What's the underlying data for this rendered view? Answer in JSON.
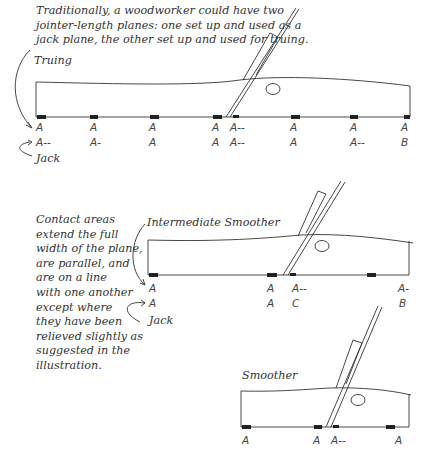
{
  "intro": {
    "lines": [
      "Traditionally, a woodworker could have two",
      "jointer-length planes: one set up and used as a",
      "jack plane, the other set up and used for truing."
    ]
  },
  "side_note": {
    "lines": [
      "Contact areas",
      "extend the full",
      "width of the plane,",
      "are parallel, and",
      "are on a line",
      "with one another",
      "except where",
      "they have been",
      "relieved slightly as",
      "suggested in the",
      "illustration."
    ]
  },
  "planes": [
    {
      "name": "jointer",
      "labels": {
        "top": "Truing",
        "bottom": "Jack"
      },
      "row1": [
        "A",
        "A",
        "A",
        "A",
        "A--",
        "A",
        "A",
        "A"
      ],
      "row2": [
        "A--",
        "A-",
        "A",
        "A",
        "A--",
        "A",
        "A--",
        "B"
      ]
    },
    {
      "name": "Intermediate Smoother",
      "labels": {
        "top": "Intermediate Smoother",
        "bottom": "Jack"
      },
      "row1": [
        "A",
        "A",
        "A--",
        "A-"
      ],
      "row2": [
        "A",
        "A",
        "C",
        "B"
      ]
    },
    {
      "name": "Smoother",
      "labels": {
        "top": "Smoother"
      },
      "row1": [
        "A",
        "A",
        "A--",
        "A"
      ]
    }
  ]
}
